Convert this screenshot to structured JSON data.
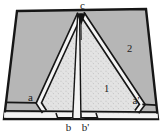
{
  "figure": {
    "type": "paper-folding-diagram",
    "labels": {
      "apex": "c",
      "left_fold_point": "a",
      "right_fold_point": "a'",
      "slit_left": "b",
      "slit_right": "b'",
      "region_flap": "1",
      "region_sheet": "2"
    },
    "colors": {
      "background": "#ffffff",
      "paper": "#b6b6b6",
      "flap_back": "#e3e3e3",
      "band": "#f3f3f3",
      "line": "#161616"
    }
  }
}
